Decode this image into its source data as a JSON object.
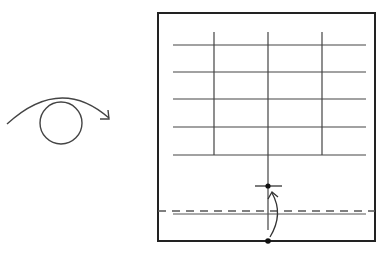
{
  "diagram": {
    "symbols": [
      {
        "name": "turn-over-symbol",
        "meaning": "Turn the model over"
      },
      {
        "name": "fold-arrow",
        "meaning": "Fold bottom edge up so the dot meets the marked dot"
      }
    ],
    "colors": {
      "stroke": "#333333",
      "background": "#ffffff",
      "dashed": "#555555"
    },
    "grid": {
      "horizontal_lines": 5,
      "vertical_lines": 3
    }
  }
}
